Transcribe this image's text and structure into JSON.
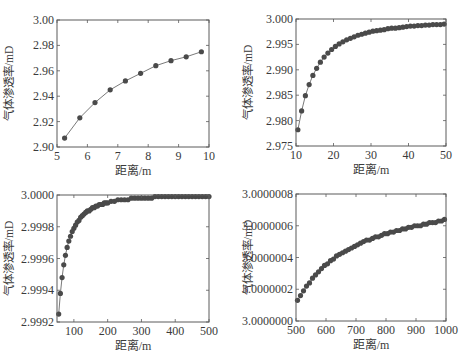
{
  "figure": {
    "width": 466,
    "height": 360,
    "marker_color": "#4a4a4a",
    "line_color": "#6a6a6a",
    "axis_color": "#5a5a5a",
    "text_color": "#3a3a3a"
  },
  "chart_data": [
    {
      "type": "line",
      "panel": "top-left",
      "title": "",
      "xlabel": "距离/m",
      "ylabel": "气体渗透率/mD",
      "xlim": [
        5,
        10
      ],
      "ylim": [
        2.9,
        3.0
      ],
      "xticks": [
        5,
        6,
        7,
        8,
        9,
        10
      ],
      "xtick_labels": [
        "5",
        "6",
        "7",
        "8",
        "9",
        "10"
      ],
      "yticks": [
        2.9,
        2.92,
        2.94,
        2.96,
        2.98,
        3.0
      ],
      "ytick_labels": [
        "2.90",
        "2.92",
        "2.94",
        "2.96",
        "2.98",
        "3.00"
      ],
      "grid": false,
      "marker": "circle",
      "box": [
        57,
        20,
        209,
        147
      ],
      "series": [
        {
          "name": "气体渗透率",
          "x": [
            5.25,
            5.75,
            6.25,
            6.75,
            7.25,
            7.75,
            8.25,
            8.75,
            9.25,
            9.75
          ],
          "y": [
            2.907,
            2.923,
            2.935,
            2.945,
            2.952,
            2.958,
            2.964,
            2.968,
            2.971,
            2.975
          ]
        }
      ]
    },
    {
      "type": "line",
      "panel": "top-right",
      "title": "",
      "xlabel": "距离/m",
      "ylabel": "气体渗透率/mD",
      "xlim": [
        10,
        50
      ],
      "ylim": [
        2.975,
        3.0
      ],
      "xticks": [
        10,
        20,
        30,
        40,
        50
      ],
      "xtick_labels": [
        "10",
        "20",
        "30",
        "40",
        "50"
      ],
      "yticks": [
        2.975,
        2.98,
        2.985,
        2.99,
        2.995,
        3.0
      ],
      "ytick_labels": [
        "2.975",
        "2.980",
        "2.985",
        "2.990",
        "2.995",
        "3.000"
      ],
      "grid": false,
      "marker": "circle",
      "box": [
        296,
        19,
        446,
        146
      ],
      "series": [
        {
          "name": "气体渗透率",
          "x": [
            10.5,
            11.5,
            12.5,
            13.5,
            14.5,
            15.5,
            16.5,
            17.5,
            18.5,
            19.5,
            20.5,
            21.5,
            22.5,
            23.5,
            24.5,
            25.5,
            26.5,
            27.5,
            28.5,
            29.5,
            30.5,
            31.5,
            32.5,
            33.5,
            34.5,
            35.5,
            36.5,
            37.5,
            38.5,
            39.5,
            40.5,
            41.5,
            42.5,
            43.5,
            44.5,
            45.5,
            46.5,
            47.5,
            48.5,
            49.5
          ],
          "y": [
            2.9782,
            2.9819,
            2.9849,
            2.9871,
            2.9889,
            2.9903,
            2.9915,
            2.9925,
            2.9933,
            2.994,
            2.9946,
            2.9951,
            2.9955,
            2.9959,
            2.9962,
            2.9965,
            2.9968,
            2.997,
            2.9972,
            2.9974,
            2.9976,
            2.9977,
            2.9978,
            2.9979,
            2.9981,
            2.9982,
            2.9982,
            2.9983,
            2.9984,
            2.9985,
            2.9986,
            2.9986,
            2.9987,
            2.9987,
            2.9988,
            2.9988,
            2.9989,
            2.9989,
            2.9989,
            2.999
          ]
        }
      ]
    },
    {
      "type": "line",
      "panel": "bottom-left",
      "title": "",
      "xlabel": "距离/m",
      "ylabel": "气体渗透率/mD",
      "xlim": [
        50,
        500
      ],
      "ylim": [
        2.9992,
        3.0
      ],
      "xticks": [
        100,
        200,
        300,
        400,
        500
      ],
      "xtick_labels": [
        "100",
        "200",
        "300",
        "400",
        "500"
      ],
      "yticks": [
        2.9992,
        2.9994,
        2.9996,
        2.9998,
        3.0
      ],
      "ytick_labels": [
        "2.9992",
        "2.9994",
        "2.9996",
        "2.9998",
        "3.0000"
      ],
      "grid": false,
      "marker": "circle",
      "box": [
        57,
        195,
        209,
        322
      ],
      "series": [
        {
          "name": "气体渗透率",
          "x": [
            55,
            60,
            65,
            70,
            75,
            80,
            85,
            90,
            95,
            100,
            105,
            110,
            115,
            120,
            125,
            130,
            135,
            140,
            145,
            150,
            155,
            160,
            165,
            170,
            175,
            180,
            185,
            190,
            195,
            200,
            210,
            220,
            230,
            240,
            250,
            260,
            270,
            280,
            290,
            300,
            310,
            320,
            330,
            340,
            350,
            360,
            370,
            380,
            390,
            400,
            410,
            420,
            430,
            440,
            450,
            460,
            470,
            480,
            490,
            500
          ],
          "y": [
            2.99925,
            2.99938,
            2.99948,
            2.99956,
            2.99962,
            2.99967,
            2.99971,
            2.99974,
            2.99977,
            2.99979,
            2.99981,
            2.99983,
            2.99984,
            2.99986,
            2.99987,
            2.99988,
            2.99989,
            2.9999,
            2.9999,
            2.99991,
            2.99992,
            2.99992,
            2.99993,
            2.99993,
            2.99994,
            2.99994,
            2.99994,
            2.99995,
            2.99995,
            2.99995,
            2.99996,
            2.99996,
            2.99997,
            2.99997,
            2.99997,
            2.99997,
            2.99998,
            2.99998,
            2.99998,
            2.99998,
            2.99998,
            2.99998,
            2.99998,
            2.99999,
            2.99999,
            2.99999,
            2.99999,
            2.99999,
            2.99999,
            2.99999,
            2.99999,
            2.99999,
            2.99999,
            2.99999,
            2.99999,
            2.99999,
            2.99999,
            2.99999,
            2.99999,
            2.99999
          ]
        }
      ]
    },
    {
      "type": "line",
      "panel": "bottom-right",
      "title": "",
      "xlabel": "距离/m",
      "ylabel": "气体渗透率/mD",
      "xlim": [
        500,
        1000
      ],
      "ylim": [
        3.0,
        3.0000008
      ],
      "xticks": [
        500,
        600,
        700,
        800,
        900,
        1000
      ],
      "xtick_labels": [
        "500",
        "600",
        "700",
        "800",
        "900",
        "1000"
      ],
      "yticks": [
        3.0,
        3.0000002,
        3.0000004,
        3.0000006,
        3.0000008
      ],
      "ytick_labels": [
        "3.0000000",
        "3.0000002",
        "3.0000004",
        "3.0000006",
        "3.0000008"
      ],
      "grid": false,
      "marker": "circle",
      "box": [
        296,
        194,
        446,
        321
      ],
      "series": [
        {
          "name": "气体渗透率",
          "x": [
            505,
            515,
            525,
            535,
            545,
            555,
            565,
            575,
            585,
            595,
            605,
            615,
            625,
            635,
            645,
            655,
            665,
            675,
            685,
            695,
            705,
            715,
            725,
            735,
            745,
            755,
            765,
            775,
            785,
            795,
            805,
            815,
            825,
            835,
            845,
            855,
            865,
            875,
            885,
            895,
            905,
            915,
            925,
            935,
            945,
            955,
            965,
            975,
            985,
            995
          ],
          "y": [
            3.00000013,
            3.00000016,
            3.00000019,
            3.00000022,
            3.00000024,
            3.00000027,
            3.00000029,
            3.00000031,
            3.00000033,
            3.00000035,
            3.00000036,
            3.00000038,
            3.00000039,
            3.00000041,
            3.00000042,
            3.00000043,
            3.00000044,
            3.00000045,
            3.00000046,
            3.00000047,
            3.00000048,
            3.00000049,
            3.0000005,
            3.00000051,
            3.00000051,
            3.00000052,
            3.00000053,
            3.00000053,
            3.00000054,
            3.00000055,
            3.00000055,
            3.00000056,
            3.00000056,
            3.00000057,
            3.00000057,
            3.00000058,
            3.00000058,
            3.00000059,
            3.00000059,
            3.0000006,
            3.0000006,
            3.0000006,
            3.00000061,
            3.00000061,
            3.00000062,
            3.00000062,
            3.00000062,
            3.00000063,
            3.00000063,
            3.00000064
          ]
        }
      ]
    }
  ]
}
